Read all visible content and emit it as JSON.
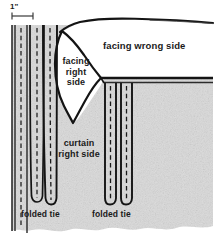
{
  "figure": {
    "canvas": {
      "width": 214,
      "height": 242
    },
    "colors": {
      "background": "#ffffff",
      "fabric_fill": "#d9d9d9",
      "fabric_light": "#e8e8e8",
      "ink": "#111111",
      "stitch": "#1a1a1a",
      "facing_wrong_side_fill": "#ffffff"
    }
  },
  "labels": {
    "measurement": "1\"",
    "facing_wrong_side": "facing wrong side",
    "facing_right_side_line1": "facing",
    "facing_right_side_line2": "right",
    "facing_right_side_line3": "side",
    "curtain_line1": "curtain",
    "curtain_line2": "right side",
    "folded_tie_left": "folded tie",
    "folded_tie_right": "folded tie"
  },
  "annotations": {
    "dimension_line": {
      "label": "1\"",
      "x_start": 12,
      "x_end": 33,
      "y": 16
    }
  },
  "parts": {
    "ties_left": [
      {
        "name": "tie-1",
        "stitched": true
      },
      {
        "name": "tie-2",
        "stitched": true
      },
      {
        "name": "tie-3",
        "stitched": true
      }
    ],
    "ties_right": [
      {
        "name": "tie-4",
        "stitched": true
      },
      {
        "name": "tie-5",
        "stitched": true
      }
    ],
    "facing_panel": {
      "name": "facing",
      "shape": "diamond"
    },
    "seam_right": {
      "name": "horizontal-seam",
      "y": 80
    }
  }
}
